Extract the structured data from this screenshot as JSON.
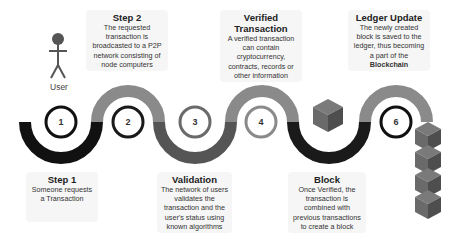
{
  "diagram": {
    "colors": {
      "black_segment": "#111111",
      "gray_segment": "#8a8a8a",
      "dark_gray_segment": "#555555",
      "cube_top": "#7a7a7a",
      "cube_left": "#6a6a6a",
      "cube_right": "#4e4e4e"
    },
    "actor": {
      "icon": "user-stick-figure-icon",
      "label": "User"
    },
    "nodes": [
      {
        "id": 1,
        "label": "1",
        "ring_color": "#111111"
      },
      {
        "id": 2,
        "label": "2",
        "ring_color": "#1a1a1a"
      },
      {
        "id": 3,
        "label": "3",
        "ring_color": "#6a6a6a"
      },
      {
        "id": 4,
        "label": "4",
        "ring_color": "#8a8a8a"
      },
      {
        "id": 5,
        "label": "",
        "icon": "cube-icon"
      },
      {
        "id": 6,
        "label": "6",
        "ring_color": "#111111"
      }
    ],
    "steps": [
      {
        "title": "Step 1",
        "description": "Someone requests a Transaction"
      },
      {
        "title": "Step 2",
        "description": "The requested transaction is broadcasted to a P2P network consisting of node computers"
      },
      {
        "title": "Validation",
        "description": "The network of users validates the transaction and the user's status using known algorithms"
      },
      {
        "title": "Verified Transaction",
        "description": "A verified transaction can contain cryptocurrency, contracts, records or other information"
      },
      {
        "title": "Block",
        "description": "Once Verified, the transaction is combined with previous transactions to create a block"
      },
      {
        "title": "Ledger Update",
        "description": "The newly created block is saved to the ledger, thus becoming a part of the",
        "description_bold": "Blockchain"
      }
    ],
    "chain_stack": {
      "icon": "blockchain-stack-icon",
      "cube_count": 4
    }
  }
}
